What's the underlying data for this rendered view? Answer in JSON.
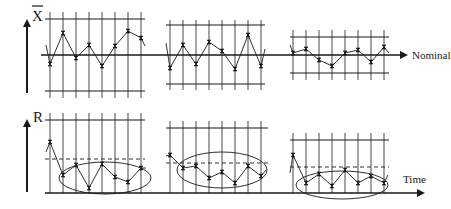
{
  "labels": {
    "xbar_axis": "X",
    "range_axis": "R",
    "nominal": "Nominal",
    "time": "Time"
  },
  "colors": {
    "ink": "#1a1a1a",
    "background": "#ffffff"
  },
  "xbar_charts": [
    {
      "x_positions": [
        50,
        63,
        76,
        89,
        102,
        115,
        128,
        141
      ],
      "control_top": 19,
      "control_bottom": 91,
      "nominal": 55,
      "v_top": 12,
      "v_bottom": 98,
      "h_left": 45,
      "h_right": 145,
      "lead": [
        46,
        45
      ],
      "points": [
        64,
        33,
        58,
        45,
        66,
        46,
        31,
        38
      ],
      "tail": [
        145,
        46
      ]
    },
    {
      "x_positions": [
        170,
        183,
        196,
        209,
        222,
        235,
        248,
        261
      ],
      "control_top": 25,
      "control_bottom": 84,
      "nominal": 55,
      "v_top": 20,
      "v_bottom": 90,
      "h_left": 166,
      "h_right": 265,
      "lead": [
        166,
        43
      ],
      "points": [
        68,
        45,
        64,
        42,
        51,
        69,
        35,
        66
      ],
      "tail": [
        265,
        49
      ]
    },
    {
      "x_positions": [
        293,
        306,
        319,
        332,
        345,
        358,
        371,
        384
      ],
      "control_top": 37,
      "control_bottom": 73,
      "nominal": 55,
      "v_top": 30,
      "v_bottom": 80,
      "h_left": 290,
      "h_right": 389,
      "lead": [
        290,
        45
      ],
      "points": [
        53,
        49,
        60,
        66,
        53,
        50,
        62,
        47
      ],
      "tail": [
        389,
        53
      ]
    }
  ],
  "range_charts": [
    {
      "x_positions": [
        50,
        63,
        76,
        89,
        102,
        115,
        128,
        141
      ],
      "control_top": 120,
      "baseline": 193,
      "mean_dashed": 159,
      "v_top": 113,
      "h_left": 45,
      "h_right": 145,
      "lead": [
        46,
        152
      ],
      "points": [
        142,
        175,
        165,
        188,
        164,
        177,
        182,
        168
      ],
      "tail": [
        146,
        168
      ],
      "ellipse": {
        "cx": 105,
        "cy": 178,
        "rx": 46,
        "ry": 16
      }
    },
    {
      "x_positions": [
        170,
        183,
        196,
        209,
        222,
        235,
        248,
        261
      ],
      "control_top": 128,
      "baseline": 193,
      "mean_dashed": 163,
      "v_top": 121,
      "h_left": 166,
      "h_right": 268,
      "lead": [
        166,
        156
      ],
      "points": [
        155,
        168,
        166,
        178,
        172,
        183,
        166,
        176
      ],
      "tail": [
        266,
        170
      ],
      "ellipse": {
        "cx": 222,
        "cy": 170,
        "rx": 45,
        "ry": 18
      }
    },
    {
      "x_positions": [
        293,
        306,
        319,
        332,
        345,
        358,
        371,
        384
      ],
      "control_top": 140,
      "baseline": 193,
      "mean_dashed": 167,
      "v_top": 133,
      "h_left": 290,
      "h_right": 389,
      "lead": [
        290,
        173
      ],
      "points": [
        155,
        183,
        174,
        186,
        170,
        183,
        176,
        183
      ],
      "tail": [
        388,
        175
      ],
      "ellipse": {
        "cx": 342,
        "cy": 185,
        "rx": 46,
        "ry": 14
      }
    }
  ],
  "axes": {
    "xbar_arrow": {
      "x": 27,
      "y_top": 17,
      "y_bottom": 93
    },
    "range_arrow": {
      "x": 27,
      "y_top": 117,
      "y_bottom": 192
    },
    "nominal_arrow": {
      "x_start": 41,
      "x_end": 410,
      "y": 55
    },
    "time_arrow": {
      "x_start": 45,
      "x_end": 427,
      "y": 193
    }
  }
}
